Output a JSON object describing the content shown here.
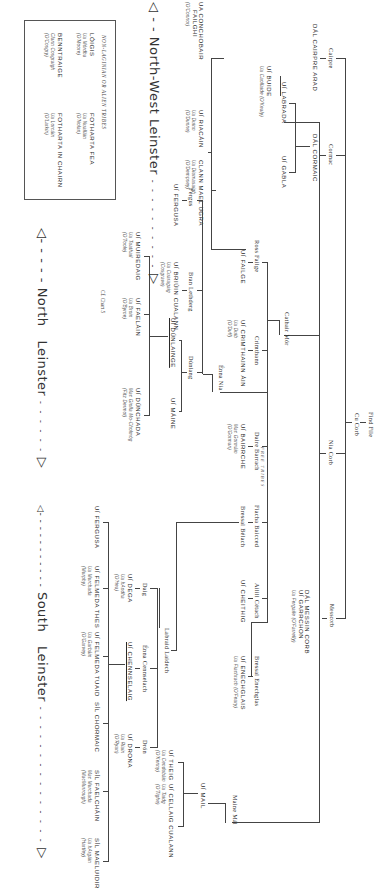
{
  "diagram": {
    "type": "genealogical-tree",
    "orientation": "rotated-90-clockwise",
    "root": {
      "name": "Find File",
      "child": "Cu Corb"
    },
    "ancestors": {
      "cu_corb": "Cu Corb",
      "nia_corb": "Nia Corb",
      "messcorb": "Messcorb",
      "cathair_mor": "Cathair Mór",
      "mane_mal": "Maine Mál",
      "cairpre": "Cairpre",
      "cormac": "Cormac"
    },
    "nodes": {
      "find_file": "Find File",
      "cu_corb": "Cu Corb",
      "nia_corb": "Nia Corb",
      "messcorb": "Messcorb",
      "dal_messin_corb": {
        "name": "DÁL MESSIN CORB",
        "name2": "UÍ GARRCHON",
        "sub": "Ua Fergaile (O'Farrelly)"
      },
      "maine_mal": "Maine Mál",
      "ui_mail": "UÍ MAIL",
      "ui_theig": {
        "name": "UÍ THEIG",
        "sub1": "Ua Cendubáin",
        "sub2": "(O'Kenny)"
      },
      "ui_cellaig_cualann": {
        "name": "UÍ CELLAIG CUALANN",
        "sub1": "Ua Taidg",
        "sub2": "(O'Tighe)"
      },
      "cairpre": "Cairpre",
      "cormac": "Cormac",
      "dal_cairpre_arad": "DÁL CAIRPRE ARAD",
      "dal_cormaic": "DÁL CORMAIC",
      "ui_labrada": "UÍ LABRADA",
      "ui_buide": {
        "name": "UÍ BUIDE",
        "sub": "Ua Caollaide (O'Kealy)"
      },
      "ui_gabla": "UÍ GABLA",
      "cathair_mor": "Cathair Mór",
      "ross_failge": "Ross Failge",
      "ui_failge": "UÍ FAILGE",
      "ua_conchobair_failgi": {
        "name": "UA CONCHOBAIR",
        "name2": "FAILGHI",
        "sub": "(O'Connor)"
      },
      "ui_riacain": {
        "name": "UÍ RIACÁIN",
        "sub1": "Ua Duinn",
        "sub2": "(O'Dunne)"
      },
      "clann_maelugra": {
        "name": "CLANN MAEL UGRA",
        "sub1": "Ua Diumasaigh",
        "sub2": "(O'Dempsey)"
      },
      "crimthann": "Crimthann",
      "ui_crimthainn_ain": {
        "name": "UÍ CRIMTHAINN ÁIN",
        "sub1": "Ua Duib",
        "sub2": "(O'Duff)"
      },
      "daire_barrach": "Daire Barrach",
      "ui_bairrche": {
        "name": "UÍ BAIRRCHE",
        "sub1": "Mac Gormáin",
        "sub2": "(O'Gorman)"
      },
      "fiacha_baicced": "Fiacha Baicced",
      "bressal_belach": "Bressal Bélach",
      "ailill_cetach": "Ailill Cétach",
      "ui_cheithig": "UÍ CHEITHIG",
      "bressal_enechglas": "Bressal Enechglas",
      "ui_enechglais": {
        "name": "UÍ ENECHGLAIS",
        "sub": "Ua Fiachrach (O'Feary)"
      },
      "enna_nia": "Énna Nia",
      "fergus": "Fergus",
      "ui_fergusa_n": "UÍ FERGUSA",
      "bran_lethderg": "Bran Lethderg",
      "ui_briuin_cualann": {
        "name": "UÍ BRIÚIN CUALANN",
        "sub1": "Ua Cuaragaig",
        "sub2": "(Cosgrave)"
      },
      "dunlaing": "Dúnlang",
      "ui_dunlainge": "UÍ DÚNLAINGE",
      "ui_maine": "UÍ MÁINE",
      "ui_muiredaig": {
        "name": "UÍ MUIREDAIG",
        "sub1": "Ua Tuathail",
        "sub2": "(O'Toole)"
      },
      "ui_faelain": {
        "name": "UÍ FAELÁIN",
        "sub1": "Ua Broin",
        "sub2": "(O'Byrne)"
      },
      "ui_dunchada": {
        "name": "UÍ DÚNCHADA",
        "sub1": "Mac Giolla Mo-Cholmóg",
        "sub2": "(Fitz Dermot)"
      },
      "chart_ref": "Cf. Chart 5",
      "labraid_laidech": "Labraid Laidech",
      "daig": "Daig",
      "ui_dega": {
        "name": "UÍ DEGA",
        "sub1": "Ua hAodha",
        "sub2": "(O'Hea)"
      },
      "enna_cennselach": "Énna Cennselach",
      "ui_chennselaig": "UÍ CHENNSELAIG",
      "drón": "Drón",
      "ui_drona": {
        "name": "UÍ DRONA",
        "sub1": "Ua Riain",
        "sub2": "(O'Ryan)"
      },
      "ui_fergusa_s": "UÍ FERGUSA",
      "ui_felmeda_thes": {
        "name": "UÍ FELMEDA THES",
        "sub1": "Ua Murchada",
        "sub2": "(Murphy)"
      },
      "ui_felmeda_tuaid": {
        "name": "UÍ FELMEDA TUAID",
        "sub1": "Ua Garbáin",
        "sub2": "(O'Garvey)"
      },
      "sil_chormaic": "SÍL CHORMAIC",
      "sil_faelchain": {
        "name": "SÍL FAELCHÁIN",
        "sub1": "Mac Murchada",
        "sub2": "(MacMurrough)"
      },
      "sil_mella": {
        "name": "SÍL MAELUIDIR",
        "sub1": "Ua hArgáin",
        "sub2": "(Hartley)"
      },
      "free_tribes": "FREE TRIBES"
    },
    "legend_box": {
      "title": "NON-LAGINIAN OR ALIEN TRIBES",
      "entries": [
        {
          "name": "LÓIGIS",
          "sub1": "Ua Mórdha",
          "sub2": "(O'Moore)"
        },
        {
          "name": "FOTHARTA FEA",
          "sub1": "Ua Nualláin",
          "sub2": "(O'Nolan)"
        },
        {
          "name": "BENNTRAIGE",
          "sub1": "Clann Cosgraigh",
          "sub2": "(O'Cosgry)"
        },
        {
          "name": "FOTHARTA IN CHAIRN",
          "sub1": "Ua Lorcáin",
          "sub2": "(O'Larkin)"
        }
      ]
    },
    "regions": [
      {
        "label": "North-West Leinster",
        "left_arrow": "◁ - -",
        "dashes": "- - - - - - - - - -",
        "right_arrow": "▷"
      },
      {
        "label": "North   Leinster",
        "left_arrow": "◁- - - - -",
        "dashes": "- - - - - -",
        "right_arrow": "▷"
      },
      {
        "label": "South   Leinster",
        "left_arrow": "◁- - - - - - - - - - -",
        "dashes": "- - - - - - - - - - - - - - -",
        "right_arrow": "▷"
      }
    ]
  }
}
